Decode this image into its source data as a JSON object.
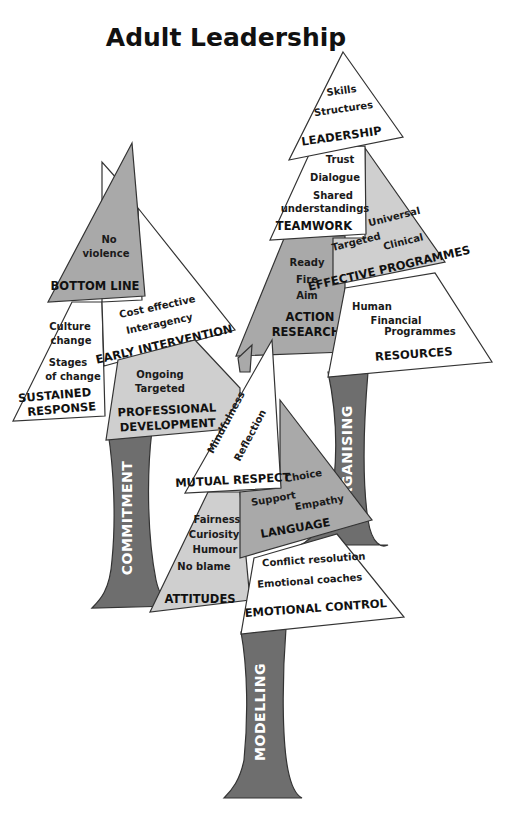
{
  "title": "Adult Leadership",
  "colors": {
    "background": "#ffffff",
    "white_section": "#ffffff",
    "light_section": "#cfcfcf",
    "mid_section": "#a9a9a9",
    "trunk": "#6e6e6e",
    "outline": "#333333",
    "text": "#1a1a1a"
  },
  "trees": {
    "commitment": {
      "trunk_label": "COMMITMENT",
      "sections": {
        "bottom_line": {
          "heading": "BOTTOM LINE",
          "items": [
            "No",
            "violence"
          ]
        },
        "early_intervention": {
          "heading": "EARLY INTERVENTION",
          "items": [
            "Cost effective",
            "Interagency"
          ]
        },
        "sustained_response": {
          "heading_line1": "SUSTAINED",
          "heading_line2": "RESPONSE",
          "items": [
            "Culture",
            "change",
            "Stages",
            "of change"
          ]
        },
        "professional_development": {
          "heading_line1": "PROFESSIONAL",
          "heading_line2": "DEVELOPMENT",
          "items": [
            "Ongoing",
            "Targeted"
          ]
        }
      }
    },
    "organising": {
      "trunk_label": "ORGANISING",
      "sections": {
        "leadership": {
          "heading": "LEADERSHIP",
          "items": [
            "Skills",
            "Structures"
          ]
        },
        "teamwork": {
          "heading": "TEAMWORK",
          "items": [
            "Trust",
            "Dialogue",
            "Shared",
            "understandings"
          ]
        },
        "effective_programmes": {
          "heading": "EFFECTIVE PROGRAMMES",
          "items": [
            "Universal",
            "Targeted",
            "Clinical"
          ]
        },
        "action_research": {
          "heading_line1": "ACTION",
          "heading_line2": "RESEARCH",
          "items": [
            "Ready",
            "Fire",
            "Aim"
          ]
        },
        "resources": {
          "heading": "RESOURCES",
          "items": [
            "Human",
            "Financial",
            "Programmes"
          ]
        }
      }
    },
    "modelling": {
      "trunk_label": "MODELLING",
      "sections": {
        "mutual_respect": {
          "heading": "MUTUAL RESPECT",
          "items": [
            "Mindfulness",
            "Reflection"
          ]
        },
        "language": {
          "heading": "LANGUAGE",
          "items": [
            "Choice",
            "Support",
            "Empathy"
          ]
        },
        "attitudes": {
          "heading": "ATTITUDES",
          "items": [
            "Fairness",
            "Curiosity",
            "Humour",
            "No blame"
          ]
        },
        "emotional_control": {
          "heading": "EMOTIONAL CONTROL",
          "items": [
            "Conflict resolution",
            "Emotional coaches"
          ]
        }
      }
    }
  }
}
